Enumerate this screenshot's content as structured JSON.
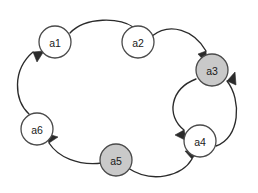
{
  "diagram": {
    "type": "directed-graph",
    "background_color": "#ffffff",
    "node_stroke_color": "#4a4a4a",
    "edge_color": "#2b2b2b",
    "node_fill_plain": "#ffffff",
    "node_fill_shaded": "#c9c9c9",
    "node_radius": 16,
    "nodes": [
      {
        "id": "a1",
        "label": "a1",
        "cx": 55,
        "cy": 42,
        "shaded": false
      },
      {
        "id": "a2",
        "label": "a2",
        "cx": 138,
        "cy": 42,
        "shaded": false
      },
      {
        "id": "a3",
        "label": "a3",
        "cx": 212,
        "cy": 70,
        "shaded": true
      },
      {
        "id": "a4",
        "label": "a4",
        "cx": 200,
        "cy": 141,
        "shaded": false
      },
      {
        "id": "a5",
        "label": "a5",
        "cx": 116,
        "cy": 160,
        "shaded": true
      },
      {
        "id": "a6",
        "label": "a6",
        "cx": 37,
        "cy": 129,
        "shaded": false
      }
    ],
    "edges": [
      {
        "id": "a1-a2",
        "from": "a1",
        "to": "a2",
        "directed": true
      },
      {
        "id": "a2-a3",
        "from": "a2",
        "to": "a3",
        "directed": true
      },
      {
        "id": "a3-a4",
        "from": "a3",
        "to": "a4",
        "directed": true
      },
      {
        "id": "a4-a3",
        "from": "a4",
        "to": "a3",
        "directed": true
      },
      {
        "id": "a5-a4",
        "from": "a5",
        "to": "a4",
        "directed": true
      },
      {
        "id": "a5-a6",
        "from": "a5",
        "to": "a6",
        "directed": true
      },
      {
        "id": "a6-a1",
        "from": "a6",
        "to": "a1",
        "directed": true
      }
    ],
    "geometry": {
      "edge_a1_a2": "M 70 33 C 86 16, 120 18, 133 27",
      "arrow_a1_a2": "133,27 142,36 130,37",
      "edge_a2_a3": "M 152 36 C 170 22, 194 30, 206 51",
      "arrow_a2_a3": "206,51 207,64 198,54",
      "edge_a3_a4": "M 196 79 C 170 89, 166 116, 184 130",
      "arrow_a3_a4": "184,130 187,141 175,135",
      "edge_a4_a3": "M 216 146 C 240 138, 242 100, 227 81",
      "arrow_a4_a3": "227,81 235,72, 236,85",
      "edge_a5_a4": "M 128 168 C 152 184, 182 176, 192 159",
      "arrow_a5_a4": "192,159 198,151 185,151",
      "edge_a5_a6": "M 102 163 C 78 166, 58 157, 49 143",
      "arrow_a5_a6": "49,143 45,133 58,137",
      "edge_a6_a1": "M 29 114 C 14 100, 12 70, 33 52",
      "arrow_a6_a1": "33,52 44,51 37,62"
    }
  }
}
